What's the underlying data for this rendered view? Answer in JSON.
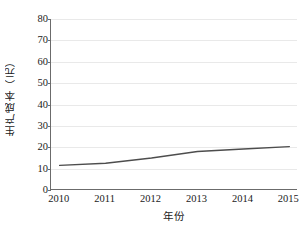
{
  "chart_data": {
    "type": "line",
    "title": "",
    "xlabel": "年份",
    "ylabel": "生产成本（元）",
    "categories": [
      "2010",
      "2011",
      "2012",
      "2013",
      "2014",
      "2015"
    ],
    "x": [
      2010,
      2011,
      2012,
      2013,
      2014,
      2015
    ],
    "values": [
      11.5,
      12.5,
      15.0,
      18.0,
      19.2,
      20.3
    ],
    "series": [
      {
        "name": "生产成本",
        "values": [
          11.5,
          12.5,
          15.0,
          18.0,
          19.2,
          20.3
        ]
      }
    ],
    "ylim": [
      0,
      80
    ],
    "yticks": [
      0,
      10,
      20,
      30,
      40,
      50,
      60,
      70,
      80
    ],
    "ytick_labels": [
      "0",
      "10",
      "20",
      "30",
      "40",
      "50",
      "60",
      "70",
      "80"
    ],
    "xlim": [
      2010,
      2015
    ],
    "grid": "horizontal",
    "legend": "none",
    "line_color": "#4d4d4d",
    "grid_color": "#e9e9e9",
    "axis_color": "#6b6b6b",
    "markers": "none"
  },
  "figure": {
    "caption": ""
  }
}
